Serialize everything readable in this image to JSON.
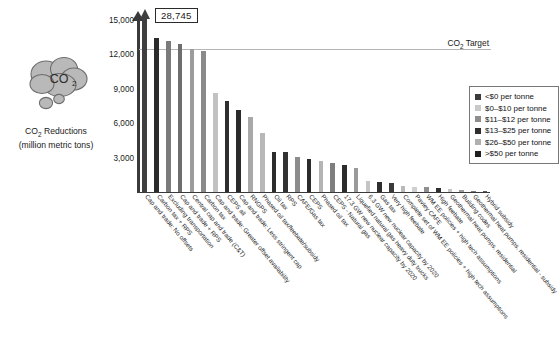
{
  "left_panel": {
    "icon": "co2-cloud-icon",
    "caption_line1_pre": "CO",
    "caption_line1_sub": "2",
    "caption_line1_post": " Reductions",
    "caption_line2": "(million metric tons)"
  },
  "callout": {
    "value_label": "28,745"
  },
  "target": {
    "label_pre": "CO",
    "label_sub": "2",
    "label_post": " Target",
    "value": 12450
  },
  "legend": {
    "items": [
      {
        "label": "<$0 per tonne",
        "color": "#3b3b3b"
      },
      {
        "label": "$0–$10 per tonne",
        "color": "#c9c9c9"
      },
      {
        "label": "$11–$12 per tonne",
        "color": "#8e8e8e"
      },
      {
        "label": "$13–$25 per tonne",
        "color": "#2e2e2e"
      },
      {
        "label": "$26–$50 per tonne",
        "color": "#b0b0b0"
      },
      {
        "label": ">$50 per tonne",
        "color": "#1f1f1f"
      }
    ]
  },
  "chart_data": {
    "type": "bar",
    "title": "",
    "xlabel": "",
    "ylabel": "CO2 Reductions (million metric tons)",
    "ylim": [
      0,
      15000
    ],
    "yticks": [
      3000,
      6000,
      9000,
      12000,
      15000
    ],
    "ytick_labels": [
      "3,000",
      "6,000",
      "9,000",
      "12,000",
      "15,000"
    ],
    "grid": false,
    "legend_position": "upper-right",
    "annotations": [
      {
        "text": "28,745",
        "target_category": "Cap and trade: No offsets"
      },
      {
        "text": "CO2 Target",
        "type": "hline",
        "value": 12450
      }
    ],
    "categories": [
      "Cap and trade: No offsets",
      "Carbon tax + RPS",
      "Excluding transportation",
      "Cap and trade + RPS",
      "Central cap and trade (C&T)",
      "Carbon tax",
      "Cap and trade: Greater offset availability",
      "CEPS all",
      "Cap and trade: Less stringent cap",
      "RNGPS",
      "Phased oil tax/feebate/subsidy",
      "Oil tax",
      "RPS",
      "CAFE/Gas tax",
      "CEPS",
      "Phased oil tax",
      "CEPS - Natural gas",
      "17.3 GW new nuclear capacity by 2020",
      "Liquefied natural gas heavy duty trucks",
      "6.3 GW new nuclear capacity by 2020",
      "Gas tax",
      "Very high feebate",
      "Complete set of WM EE policies + high tech assumptions",
      "Pavley CAFE",
      "WM EE policies + high tech assumptions",
      "High feebate",
      "Geothermal heat pumps, residential",
      "Building codes",
      "Geothermal heat pumps, residential - subsidy",
      "Hybrid subsidy"
    ],
    "values": [
      28745,
      13400,
      13150,
      12900,
      12450,
      12300,
      8650,
      7900,
      7150,
      6500,
      5150,
      3500,
      3480,
      3050,
      2850,
      2700,
      2500,
      2350,
      2100,
      1000,
      900,
      800,
      520,
      470,
      420,
      330,
      240,
      180,
      120,
      80
    ],
    "bar_colors": [
      "#3f3f3f",
      "#2b2b2b",
      "#7b7b7b",
      "#6e6e6e",
      "#9c9c9c",
      "#8a8a8a",
      "#c2c2c2",
      "#2e2e2e",
      "#2a2a2a",
      "#a8a8a8",
      "#b8b8b8",
      "#2d2d2d",
      "#323232",
      "#8c8c8c",
      "#2b2b2b",
      "#b4b4b4",
      "#7e7e7e",
      "#2c2c2c",
      "#9a9a9a",
      "#c4c4c4",
      "#2e2e2e",
      "#3a3a3a",
      "#b9b9b9",
      "#cfcfcf",
      "#8f8f8f",
      "#2f2f2f",
      "#c6c6c6",
      "#9b9b9b",
      "#7a7a7a",
      "#5a5a5a"
    ],
    "bars_displayed_as_arrow": [
      true,
      false,
      false,
      false,
      false,
      false,
      false,
      false,
      false,
      false,
      false,
      false,
      false,
      false,
      false,
      false,
      false,
      false,
      false,
      false,
      false,
      false,
      false,
      false,
      false,
      false,
      false,
      false,
      false,
      false
    ]
  }
}
